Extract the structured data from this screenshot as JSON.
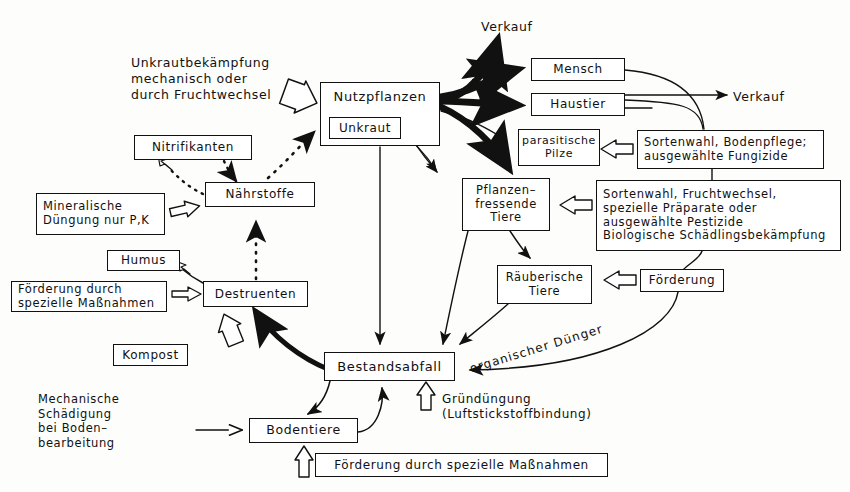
{
  "diagram": {
    "language": "de",
    "background_color": "#fdfdfb",
    "ink_color": "#111111"
  },
  "nodes": [
    {
      "id": "nutzpflanzen",
      "label": "Nutzpflanzen",
      "x": 320,
      "y": 82,
      "w": 120,
      "h": 64,
      "font": 13
    },
    {
      "id": "unkraut",
      "label": "Unkraut",
      "x": 329,
      "y": 117,
      "w": 72,
      "h": 22,
      "font": 12
    },
    {
      "id": "mensch",
      "label": "Mensch",
      "x": 531,
      "y": 58,
      "w": 94,
      "h": 23,
      "font": 12
    },
    {
      "id": "haustier",
      "label": "Haustier",
      "x": 531,
      "y": 93,
      "w": 94,
      "h": 23,
      "font": 12
    },
    {
      "id": "parasitische-pilze",
      "label_lines": [
        "parasitische",
        "Pilze"
      ],
      "x": 518,
      "y": 129,
      "w": 82,
      "h": 37,
      "font": 11
    },
    {
      "id": "pflanzenfressende-tiere",
      "label_lines": [
        "Pflanzen–",
        "fressende",
        "Tiere"
      ],
      "x": 462,
      "y": 178,
      "w": 88,
      "h": 53,
      "font": 11.5
    },
    {
      "id": "raeuberische-tiere",
      "label_lines": [
        "Räuberische",
        "Tiere"
      ],
      "x": 497,
      "y": 265,
      "w": 95,
      "h": 39,
      "font": 11.5
    },
    {
      "id": "nitrifikanten",
      "label": "Nitrifikanten",
      "x": 134,
      "y": 135,
      "w": 118,
      "h": 25,
      "font": 12
    },
    {
      "id": "naehrstoffe",
      "label": "Nährstoffe",
      "x": 205,
      "y": 182,
      "w": 110,
      "h": 25,
      "font": 12
    },
    {
      "id": "mineralische-duengung",
      "label_lines": [
        "Mineralische",
        "Düngung nur P,K"
      ],
      "x": 36,
      "y": 193,
      "w": 129,
      "h": 42,
      "font": 11.5,
      "align": "left"
    },
    {
      "id": "humus",
      "label": "Humus",
      "x": 107,
      "y": 250,
      "w": 73,
      "h": 21,
      "font": 12
    },
    {
      "id": "destruenten",
      "label": "Destruenten",
      "x": 203,
      "y": 281,
      "w": 105,
      "h": 26,
      "font": 12
    },
    {
      "id": "foerderung-spezielle-massnahmen-links",
      "label_lines": [
        "Förderung durch",
        "spezielle Maßnahmen"
      ],
      "x": 11,
      "y": 281,
      "w": 156,
      "h": 31,
      "font": 11.5,
      "align": "left"
    },
    {
      "id": "kompost",
      "label": "Kompost",
      "x": 113,
      "y": 344,
      "w": 75,
      "h": 22,
      "font": 12
    },
    {
      "id": "bestandsabfall",
      "label": "Bestandsabfall",
      "x": 324,
      "y": 352,
      "w": 131,
      "h": 29,
      "font": 13
    },
    {
      "id": "bodentiere",
      "label": "Bodentiere",
      "x": 249,
      "y": 418,
      "w": 109,
      "h": 25,
      "font": 12.5
    },
    {
      "id": "foerderung-spezielle-massnahmen-unten",
      "label": "Förderung durch spezielle Maßnahmen",
      "x": 315,
      "y": 453,
      "w": 293,
      "h": 24,
      "font": 12
    },
    {
      "id": "sortenwahl-bodenpflege",
      "label_lines": [
        "Sortenwahl, Bodenpflege;",
        "ausgewählte  Fungizide"
      ],
      "x": 637,
      "y": 130,
      "w": 187,
      "h": 39,
      "font": 11.5,
      "align": "left"
    },
    {
      "id": "sortenwahl-fruchtwechsel",
      "label_lines": [
        "Sortenwahl, Fruchtwechsel,",
        "spezielle Präparate oder",
        "ausgewählte  Pestizide",
        "Biologische  Schädlingsbekämpfung"
      ],
      "x": 596,
      "y": 180,
      "w": 245,
      "h": 71,
      "font": 11.5,
      "align": "left"
    },
    {
      "id": "foerderung",
      "label": "Förderung",
      "x": 640,
      "y": 269,
      "w": 84,
      "h": 23,
      "font": 12
    }
  ],
  "free_texts": [
    {
      "id": "unkrautbekaempfung",
      "lines": [
        "Unkrautbekämpfung",
        "mechanisch  oder",
        "durch  Fruchtwechsel"
      ],
      "x": 131,
      "y": 55,
      "font": 12.5
    },
    {
      "id": "verkauf-oben",
      "lines": [
        "Verkauf"
      ],
      "x": 481,
      "y": 19,
      "font": 12.5
    },
    {
      "id": "verkauf-rechts",
      "lines": [
        "Verkauf"
      ],
      "x": 733,
      "y": 89,
      "font": 12.5
    },
    {
      "id": "gruenduengung",
      "lines": [
        "Gründüngung",
        "(Luftstickstoffbindung)"
      ],
      "x": 442,
      "y": 392,
      "font": 12
    },
    {
      "id": "mechanische-schaedigung",
      "lines": [
        "Mechanische",
        "Schädigung",
        "bei Boden–",
        "bearbeitung"
      ],
      "x": 38,
      "y": 392,
      "font": 11.5
    }
  ],
  "curved_labels": [
    {
      "id": "organischer-duenger",
      "text": "organischer Dünger",
      "x": 470,
      "y": 362,
      "rotation": -17,
      "font": 12
    }
  ],
  "edges": [
    {
      "id": "edge-unkrautbekaempfung-to-nutzpflanzen",
      "from": "unkrautbekaempfung",
      "to": "nutzpflanzen",
      "style": "hollow-block-arrow"
    },
    {
      "id": "edge-nutzpflanzen-to-verkauf-oben",
      "from": "nutzpflanzen",
      "to": "verkauf-oben",
      "style": "thick-solid"
    },
    {
      "id": "edge-nutzpflanzen-to-mensch",
      "from": "nutzpflanzen",
      "to": "mensch",
      "style": "thick-solid"
    },
    {
      "id": "edge-nutzpflanzen-to-haustier",
      "from": "nutzpflanzen",
      "to": "haustier",
      "style": "thick-solid"
    },
    {
      "id": "edge-nutzpflanzen-to-parasitische-pilze",
      "from": "nutzpflanzen",
      "to": "parasitische-pilze",
      "style": "thin-solid"
    },
    {
      "id": "edge-nutzpflanzen-to-pflanzenfressende-tiere",
      "from": "nutzpflanzen",
      "to": "pflanzenfressende-tiere",
      "style": "thick-solid"
    },
    {
      "id": "edge-unkraut-to-pflanzenfressende-tiere",
      "from": "unkraut",
      "to": "pflanzenfressende-tiere",
      "style": "thin-solid"
    },
    {
      "id": "edge-nutzpflanzen-to-bestandsabfall",
      "from": "nutzpflanzen",
      "to": "bestandsabfall",
      "style": "thin-solid"
    },
    {
      "id": "edge-mensch-to-sortenwahl-bodenpflege",
      "from": "mensch",
      "to": "sortenwahl-bodenpflege",
      "style": "thin-curve"
    },
    {
      "id": "edge-haustier-to-sortenwahl-bodenpflege",
      "from": "haustier",
      "to": "sortenwahl-bodenpflege",
      "style": "thin-curve"
    },
    {
      "id": "edge-mensch-to-verkauf-rechts",
      "from": "mensch",
      "to": "verkauf-rechts",
      "style": "thin-solid"
    },
    {
      "id": "edge-haustier-to-verkauf-rechts",
      "from": "haustier",
      "to": "verkauf-rechts",
      "style": "thin-solid"
    },
    {
      "id": "edge-sortenwahl-bodenpflege-to-parasitische-pilze",
      "from": "sortenwahl-bodenpflege",
      "to": "parasitische-pilze",
      "style": "hollow-block-arrow"
    },
    {
      "id": "edge-sortenwahl-fruchtwechsel-to-pflanzenfressende-tiere",
      "from": "sortenwahl-fruchtwechsel",
      "to": "pflanzenfressende-tiere",
      "style": "hollow-block-arrow"
    },
    {
      "id": "edge-foerderung-to-raeuberische-tiere",
      "from": "foerderung",
      "to": "raeuberische-tiere",
      "style": "hollow-block-arrow"
    },
    {
      "id": "edge-pflanzenfressende-tiere-to-raeuberische-tiere",
      "from": "pflanzenfressende-tiere",
      "to": "raeuberische-tiere",
      "style": "thin-solid"
    },
    {
      "id": "edge-pflanzenfressende-tiere-to-bestandsabfall",
      "from": "pflanzenfressende-tiere",
      "to": "bestandsabfall",
      "style": "thin-solid"
    },
    {
      "id": "edge-raeuberische-tiere-to-bestandsabfall",
      "from": "raeuberische-tiere",
      "to": "bestandsabfall",
      "style": "thin-solid"
    },
    {
      "id": "edge-foerderung-to-bestandsabfall",
      "from": "foerderung",
      "to": "bestandsabfall",
      "label": "organischer Dünger",
      "style": "thin-curve"
    },
    {
      "id": "edge-bestandsabfall-to-destruenten",
      "from": "bestandsabfall",
      "to": "destruenten",
      "style": "thick-curve"
    },
    {
      "id": "edge-bestandsabfall-to-bodentiere",
      "from": "bestandsabfall",
      "to": "bodentiere",
      "style": "thin-curve"
    },
    {
      "id": "edge-bodentiere-to-bestandsabfall",
      "from": "bodentiere",
      "to": "bestandsabfall",
      "style": "thin-curve"
    },
    {
      "id": "edge-kompost-to-destruenten",
      "from": "kompost",
      "to": "destruenten",
      "style": "hollow-block-arrow"
    },
    {
      "id": "edge-foerderung-links-to-destruenten",
      "from": "foerderung-spezielle-massnahmen-links",
      "to": "destruenten",
      "style": "hollow-block-arrow"
    },
    {
      "id": "edge-destruenten-to-humus",
      "from": "destruenten",
      "to": "humus",
      "style": "hollow-block-arrow"
    },
    {
      "id": "edge-destruenten-to-naehrstoffe",
      "from": "destruenten",
      "to": "naehrstoffe",
      "style": "dotted"
    },
    {
      "id": "edge-naehrstoffe-to-nitrifikanten",
      "from": "naehrstoffe",
      "to": "nitrifikanten",
      "style": "dotted-hollow"
    },
    {
      "id": "edge-nitrifikanten-to-naehrstoffe",
      "from": "nitrifikanten",
      "to": "naehrstoffe",
      "style": "dotted"
    },
    {
      "id": "edge-naehrstoffe-to-nutzpflanzen",
      "from": "naehrstoffe",
      "to": "nutzpflanzen",
      "style": "dotted"
    },
    {
      "id": "edge-mineralische-duengung-to-naehrstoffe",
      "from": "mineralische-duengung",
      "to": "naehrstoffe",
      "style": "hollow-block-arrow"
    },
    {
      "id": "edge-mechanische-schaedigung-to-bodentiere",
      "from": "mechanische-schaedigung",
      "to": "bodentiere",
      "style": "thin-open-arrow"
    },
    {
      "id": "edge-foerderung-unten-to-bodentiere",
      "from": "foerderung-spezielle-massnahmen-unten",
      "to": "bodentiere",
      "style": "hollow-block-arrow"
    },
    {
      "id": "edge-gruenduengung-to-bestandsabfall",
      "from": "gruenduengung",
      "to": "bestandsabfall",
      "style": "hollow-block-arrow"
    }
  ]
}
